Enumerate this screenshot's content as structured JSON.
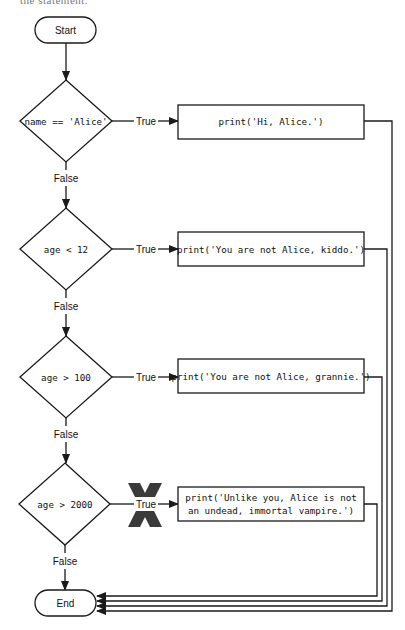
{
  "top_cutoff_text": "the statement.",
  "flowchart": {
    "start": {
      "label": "Start"
    },
    "end": {
      "label": "End"
    },
    "decisions": [
      {
        "condition": "name == 'Alice'",
        "true_label": "True",
        "false_label": "False",
        "action": [
          "print('Hi, Alice.')"
        ]
      },
      {
        "condition": "age < 12",
        "true_label": "True",
        "false_label": "False",
        "action": [
          "print('You are not Alice, kiddo.')"
        ]
      },
      {
        "condition": "age > 100",
        "true_label": "True",
        "false_label": "False",
        "action": [
          "print('You are not Alice, grannie.')"
        ]
      },
      {
        "condition": "age > 2000",
        "true_label": "True",
        "false_label": "False",
        "action": [
          "print('Unlike you, Alice is not",
          "an undead, immortal vampire.')"
        ],
        "blocked": true
      }
    ],
    "colors": {
      "stroke": "#1a1a1a",
      "x_mark": "#3a3a3a",
      "background": "#ffffff"
    }
  }
}
